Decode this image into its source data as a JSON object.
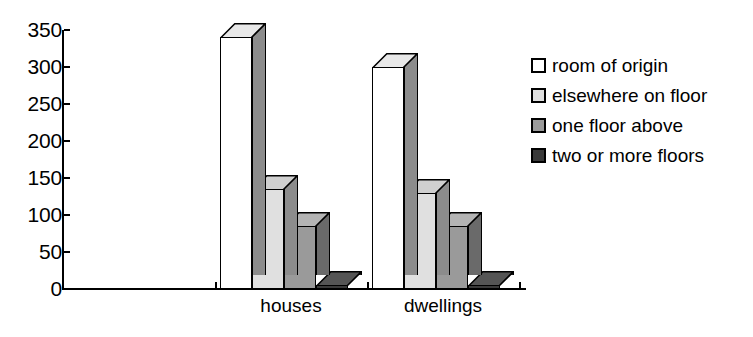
{
  "chart_data": {
    "type": "bar",
    "title": "",
    "subtitle": "",
    "xlabel": "",
    "ylabel": "",
    "categories": [
      "houses",
      "dwellings"
    ],
    "series": [
      {
        "name": "room of origin",
        "values": [
          340,
          300
        ],
        "color": "#ffffff",
        "side_color": "#8c8c8c",
        "top_color": "#e8e8e8"
      },
      {
        "name": "elsewhere on floor",
        "values": [
          135,
          130
        ],
        "color": "#e0e0e0",
        "side_color": "#8c8c8c",
        "top_color": "#d0d0d0"
      },
      {
        "name": "one floor above",
        "values": [
          85,
          85
        ],
        "color": "#9a9a9a",
        "side_color": "#6a6a6a",
        "top_color": "#b4b4b4"
      },
      {
        "name": "two or more floors",
        "values": [
          5,
          5
        ],
        "color": "#3a3a3a",
        "side_color": "#1c1c1c",
        "top_color": "#555555"
      }
    ],
    "ylim": [
      0,
      350
    ],
    "yticks": [
      0,
      50,
      100,
      150,
      200,
      250,
      300,
      350
    ],
    "ytick_labels": [
      "0",
      "50",
      "100",
      "150",
      "200",
      "250",
      "300",
      "350"
    ],
    "grid": false,
    "legend_position": "right",
    "axis_color": "#000000",
    "background_color": "#ffffff"
  },
  "legend": {
    "items": [
      {
        "label": "room of origin"
      },
      {
        "label": "elsewhere on floor"
      },
      {
        "label": "one floor above"
      },
      {
        "label": "two or more floors"
      }
    ]
  }
}
